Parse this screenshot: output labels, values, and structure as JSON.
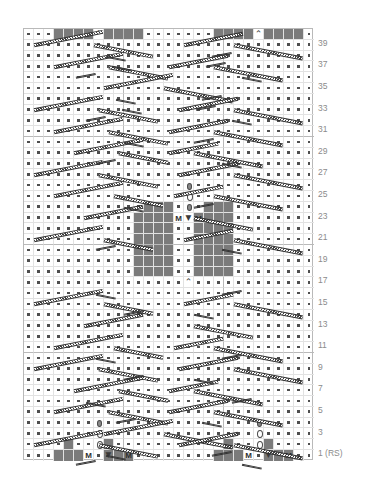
{
  "chart": {
    "type": "knitting-chart",
    "columns": 29,
    "rows": 40,
    "cell_px": 10,
    "colors": {
      "grid_line": "#e2e2e2",
      "grid_major": "#b9b9b9",
      "block_fill": "#7b7b7b",
      "symbol": "#3a3a3a",
      "row_number": "#8b8b8b",
      "background": "#ffffff"
    }
  },
  "row_numbers": [
    {
      "row": 39,
      "label": "39"
    },
    {
      "row": 37,
      "label": "37"
    },
    {
      "row": 35,
      "label": "35"
    },
    {
      "row": 33,
      "label": "33"
    },
    {
      "row": 31,
      "label": "31"
    },
    {
      "row": 29,
      "label": "29"
    },
    {
      "row": 27,
      "label": "27"
    },
    {
      "row": 25,
      "label": "25"
    },
    {
      "row": 23,
      "label": "23"
    },
    {
      "row": 21,
      "label": "21"
    },
    {
      "row": 19,
      "label": "19"
    },
    {
      "row": 17,
      "label": "17"
    },
    {
      "row": 15,
      "label": "15"
    },
    {
      "row": 13,
      "label": "13"
    },
    {
      "row": 11,
      "label": "11"
    },
    {
      "row": 9,
      "label": "9"
    },
    {
      "row": 7,
      "label": "7"
    },
    {
      "row": 5,
      "label": "5"
    },
    {
      "row": 3,
      "label": "3"
    },
    {
      "row": 1,
      "label": "1 (RS)"
    }
  ],
  "legend_symbols": {
    "purl": ".",
    "knit_block": "block",
    "make_one": "M",
    "central_double_decrease": "⌃",
    "decrease_triangle": "▼",
    "yarn_over": "o",
    "nupp": "nupp",
    "cable": "cable-bar"
  },
  "cells": {
    "blocks": [
      {
        "row": 40,
        "cols": [
          4,
          5,
          6,
          7,
          9,
          10,
          11,
          12,
          20,
          21,
          22,
          23,
          25,
          26,
          27,
          28
        ]
      },
      {
        "row": 24,
        "cols": [
          13,
          14,
          15,
          19,
          20,
          21
        ]
      },
      {
        "row": 23,
        "cols": [
          12,
          13,
          14,
          15,
          18,
          19,
          20,
          21
        ]
      },
      {
        "row": 22,
        "cols": [
          12,
          13,
          14,
          15,
          18,
          19,
          20,
          21
        ]
      },
      {
        "row": 21,
        "cols": [
          12,
          13,
          14,
          15,
          18,
          19,
          20,
          21
        ]
      },
      {
        "row": 20,
        "cols": [
          12,
          13,
          14,
          15,
          18,
          19,
          20,
          21
        ]
      },
      {
        "row": 19,
        "cols": [
          12,
          13,
          14,
          15,
          18,
          19,
          20,
          21
        ]
      },
      {
        "row": 18,
        "cols": [
          12,
          13,
          14,
          15,
          18,
          19,
          20,
          21
        ]
      },
      {
        "row": 2,
        "cols": [
          5,
          9,
          21,
          25
        ]
      },
      {
        "row": 1,
        "cols": [
          4,
          5,
          6,
          9,
          10,
          11,
          20,
          21,
          22,
          25,
          26,
          27
        ]
      }
    ],
    "make_one": [
      {
        "row": 23,
        "cols": [
          16,
          18
        ]
      },
      {
        "row": 1,
        "cols": [
          7,
          11,
          23,
          27
        ]
      }
    ],
    "decrease_triangle": [
      {
        "row": 23,
        "cols": [
          17
        ]
      },
      {
        "row": 1,
        "cols": [
          9,
          25
        ]
      }
    ],
    "central_double_decrease": [
      {
        "row": 40,
        "cols": [
          8,
          24
        ]
      },
      {
        "row": 17,
        "cols": [
          17
        ]
      }
    ],
    "yarn_over": [
      {
        "row": 25,
        "cols": [
          17
        ]
      },
      {
        "row": 3,
        "cols": [
          8,
          24
        ]
      },
      {
        "row": 2,
        "cols": [
          8,
          24
        ]
      }
    ],
    "nupp": [
      {
        "row": 26,
        "cols": [
          17
        ]
      },
      {
        "row": 24,
        "cols": [
          17
        ]
      },
      {
        "row": 4,
        "cols": [
          8,
          24
        ]
      }
    ]
  },
  "footer": {
    "rs_note": "1 (RS)"
  }
}
